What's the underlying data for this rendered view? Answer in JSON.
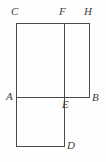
{
  "figure": {
    "kind": "geometry-diagram",
    "canvas": {
      "width": 106,
      "height": 162
    },
    "style": {
      "background_color": "#fefefe",
      "stroke_color": "#4a4a4a",
      "label_color": "#3a3a3a",
      "stroke_width": 1
    },
    "points": [
      {
        "id": "A",
        "label": "A",
        "x": 16,
        "y": 97,
        "label_x": 6,
        "label_y": 91
      },
      {
        "id": "B",
        "label": "B",
        "x": 89,
        "y": 97,
        "label_x": 92,
        "label_y": 92
      },
      {
        "id": "C",
        "label": "C",
        "x": 16,
        "y": 23,
        "label_x": 11,
        "label_y": 6
      },
      {
        "id": "D",
        "label": "D",
        "x": 64,
        "y": 146,
        "label_x": 67,
        "label_y": 140
      },
      {
        "id": "E",
        "label": "E",
        "x": 64,
        "y": 97,
        "label_x": 62,
        "label_y": 99
      },
      {
        "id": "F",
        "label": "F",
        "x": 64,
        "y": 23,
        "label_x": 59,
        "label_y": 6
      },
      {
        "id": "H",
        "label": "H",
        "x": 89,
        "y": 23,
        "label_x": 84,
        "label_y": 6
      },
      {
        "id": "G",
        "label": "",
        "x": 16,
        "y": 146,
        "label_x": 0,
        "label_y": 0
      }
    ],
    "segments": [
      {
        "name": "top-edge-CH",
        "x1": 16,
        "y1": 23,
        "x2": 89,
        "y2": 23
      },
      {
        "name": "left-edge-CA",
        "x1": 16,
        "y1": 23,
        "x2": 16,
        "y2": 97
      },
      {
        "name": "right-edge-HB",
        "x1": 89,
        "y1": 23,
        "x2": 89,
        "y2": 97
      },
      {
        "name": "middle-edge-AB",
        "x1": 16,
        "y1": 97,
        "x2": 89,
        "y2": 97
      },
      {
        "name": "divider-FE",
        "x1": 64,
        "y1": 23,
        "x2": 64,
        "y2": 97
      },
      {
        "name": "lower-right-edge-ED",
        "x1": 64,
        "y1": 97,
        "x2": 64,
        "y2": 146
      },
      {
        "name": "lower-bottom-edge",
        "x1": 16,
        "y1": 146,
        "x2": 64,
        "y2": 146
      },
      {
        "name": "lower-left-edge",
        "x1": 16,
        "y1": 97,
        "x2": 16,
        "y2": 146
      }
    ]
  }
}
